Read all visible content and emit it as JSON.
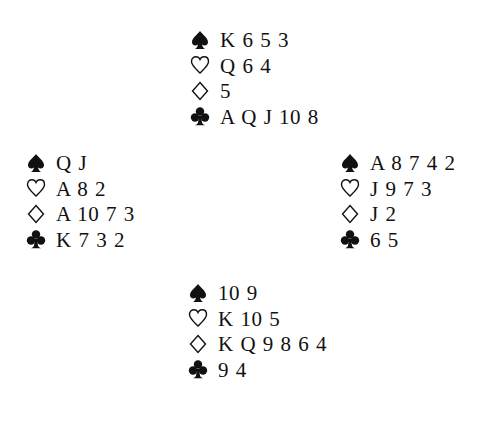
{
  "diagram": {
    "type": "bridge-deal",
    "suit_icons": {
      "spades": "spade-icon",
      "hearts": "heart-icon",
      "diamonds": "diamond-icon",
      "clubs": "club-icon"
    },
    "hands": {
      "north": {
        "spades": "K 6 5 3",
        "hearts": "Q 6 4",
        "diamonds": "5",
        "clubs": "A Q J 10 8"
      },
      "west": {
        "spades": "Q J",
        "hearts": "A 8 2",
        "diamonds": "A 10 7 3",
        "clubs": "K 7 3 2"
      },
      "east": {
        "spades": "A 8 7 4 2",
        "hearts": "J 9 7 3",
        "diamonds": "J 2",
        "clubs": "6 5"
      },
      "south": {
        "spades": "10 9",
        "hearts": "K 10 5",
        "diamonds": "K Q 9 8 6 4",
        "clubs": "9 4"
      }
    }
  }
}
